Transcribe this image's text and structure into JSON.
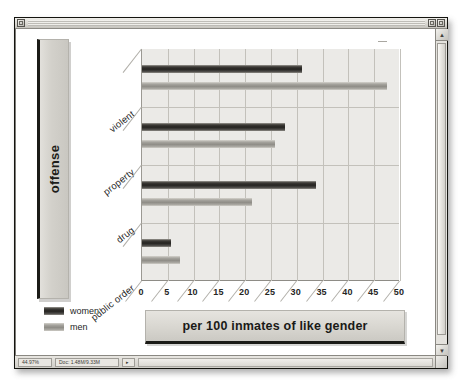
{
  "window": {
    "title": "",
    "close_box": "close-box",
    "zoom_box": "zoom-box",
    "collapse_box": "collapse-box"
  },
  "scrollbar": {
    "up_arrow": "▲",
    "down_arrow": "▼"
  },
  "statusbar": {
    "zoom_level": "44.97%",
    "doc_size": "Doc: 1.48M/9.33M",
    "menu_arrow": "▸",
    "resize_grip": "resize-grip"
  },
  "legend": {
    "position": "bottom-left",
    "items": [
      {
        "label": "women",
        "color": "#242320"
      },
      {
        "label": "men",
        "color": "#8f8d87"
      }
    ]
  },
  "axis_title": {
    "y": "offense"
  },
  "plaque": {
    "title": "per 100 inmates of like gender"
  },
  "chart_data": {
    "type": "bar",
    "orientation": "horizontal",
    "title": "per 100 inmates of like gender",
    "xlabel": "",
    "ylabel": "offense",
    "xlim": [
      0,
      50
    ],
    "xticks": [
      0,
      5,
      10,
      15,
      20,
      25,
      30,
      35,
      40,
      45,
      50
    ],
    "xticklabels": [
      "0",
      "5",
      "10",
      "15",
      "20",
      "25",
      "30",
      "35",
      "40",
      "45",
      "50"
    ],
    "categories": [
      "violent",
      "property",
      "drug",
      "public order"
    ],
    "grid": true,
    "legend_position": "bottom-left",
    "series": [
      {
        "name": "women",
        "color": "#242320",
        "values": [
          31.0,
          27.8,
          33.8,
          5.7
        ]
      },
      {
        "name": "men",
        "color": "#8f8d87",
        "values": [
          47.4,
          25.8,
          21.4,
          7.4
        ]
      }
    ]
  }
}
